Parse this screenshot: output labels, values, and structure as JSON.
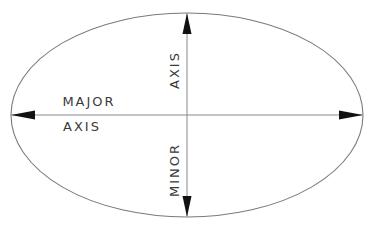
{
  "diagram": {
    "type": "ellipse-axes",
    "colors": {
      "outline": "#7a7a7a",
      "axis_line": "#8a8a8a",
      "arrowhead": "#111111",
      "text": "#3a3a3a",
      "background": "#ffffff"
    },
    "ellipse": {
      "cx": 187,
      "cy": 115,
      "rx": 176,
      "ry": 102
    },
    "labels": {
      "major_top": "MAJOR",
      "major_bottom": "AXIS",
      "minor_upper": "AXIS",
      "minor_lower": "MINOR"
    }
  }
}
